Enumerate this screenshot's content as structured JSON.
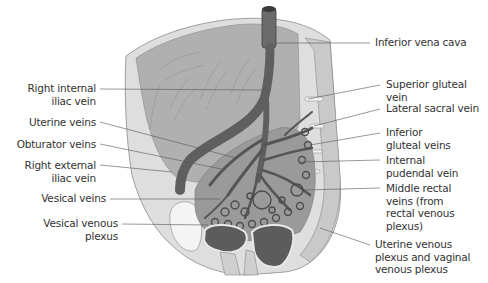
{
  "figure": {
    "colors": {
      "background": "#ffffff",
      "bone": "#d8d8d8",
      "bone_dark": "#c4c4c4",
      "muscle": "#a9a9a9",
      "vein": "#6e6e6e",
      "vein_dark": "#4f4f4f",
      "organ": "#6a6a6a",
      "leader_line": "#555555",
      "label_text": "#333333"
    }
  },
  "labels": {
    "left": [
      {
        "id": "right-internal-iliac-vein",
        "text": "Right internal\niliac vein"
      },
      {
        "id": "uterine-veins",
        "text": "Uterine veins"
      },
      {
        "id": "obturator-veins",
        "text": "Obturator veins"
      },
      {
        "id": "right-external-iliac-vein",
        "text": "Right external\niliac vein"
      },
      {
        "id": "vesical-veins",
        "text": "Vesical veins"
      },
      {
        "id": "vesical-venous-plexus",
        "text": "Vesical venous\nplexus"
      }
    ],
    "right": [
      {
        "id": "inferior-vena-cava",
        "text": "Inferior vena cava"
      },
      {
        "id": "superior-gluteal-vein",
        "text": "Superior gluteal vein"
      },
      {
        "id": "lateral-sacral-vein",
        "text": "Lateral sacral vein"
      },
      {
        "id": "inferior-gluteal-veins",
        "text": "Inferior\ngluteal veins"
      },
      {
        "id": "internal-pudendal-vein",
        "text": "Internal\npudendal vein"
      },
      {
        "id": "middle-rectal-veins",
        "text": "Middle rectal\nveins (from\nrectal venous\nplexus)"
      },
      {
        "id": "uterine-vaginal-venous-plexus",
        "text": "Uterine venous\nplexus and vaginal\nvenous plexus"
      }
    ]
  }
}
